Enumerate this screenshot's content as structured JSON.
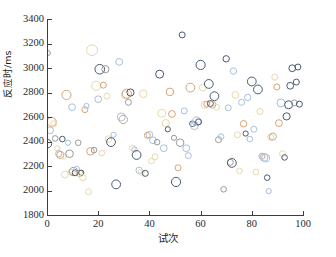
{
  "chart_data": {
    "type": "scatter",
    "title": "",
    "xlabel": "试次",
    "ylabel": "反应时/ms",
    "xlim": [
      0,
      100
    ],
    "ylim": [
      1800,
      3400
    ],
    "xticks": [
      0,
      20,
      40,
      60,
      80,
      100
    ],
    "xtick_labels": [
      "0",
      "20",
      "40",
      "60",
      "80",
      "100"
    ],
    "yticks": [
      1800,
      2000,
      2200,
      2400,
      2600,
      2800,
      3000,
      3200,
      3400
    ],
    "ytick_labels": [
      "1800",
      "2000",
      "2200",
      "2400",
      "2600",
      "2800",
      "3000",
      "3200",
      "3400"
    ],
    "grid": false,
    "legend": null,
    "marker": "open-circle",
    "marker_fill": "none",
    "palette": {
      "tan": "#d9a478",
      "light_blue": "#a8c0dd",
      "cream": "#e8d9a8",
      "gray": "#9a9a9a",
      "navy": "#4a5a72",
      "pale_orange": "#e8c49a",
      "pale_yellow": "#efe3bc"
    },
    "points": [
      {
        "x": 0.4,
        "y": 3122,
        "r": 2.4,
        "c": "gray"
      },
      {
        "x": 0.2,
        "y": 2382,
        "r": 4.2,
        "c": "navy"
      },
      {
        "x": 1.2,
        "y": 2492,
        "r": 3.4,
        "c": "light_blue"
      },
      {
        "x": 1.8,
        "y": 2560,
        "r": 4.6,
        "c": "tan"
      },
      {
        "x": 2.6,
        "y": 2545,
        "r": 3.0,
        "c": "cream"
      },
      {
        "x": 3.2,
        "y": 2425,
        "r": 2.8,
        "c": "gray"
      },
      {
        "x": 4.0,
        "y": 2345,
        "r": 2.6,
        "c": "cream"
      },
      {
        "x": 4.6,
        "y": 2300,
        "r": 3.2,
        "c": "light_blue"
      },
      {
        "x": 5.2,
        "y": 2290,
        "r": 3.6,
        "c": "tan"
      },
      {
        "x": 6.0,
        "y": 2420,
        "r": 2.8,
        "c": "navy"
      },
      {
        "x": 6.4,
        "y": 2280,
        "r": 3.0,
        "c": "cream"
      },
      {
        "x": 7.0,
        "y": 2130,
        "r": 3.4,
        "c": "cream"
      },
      {
        "x": 7.6,
        "y": 2780,
        "r": 4.6,
        "c": "tan"
      },
      {
        "x": 8.2,
        "y": 2390,
        "r": 2.6,
        "c": "light_blue"
      },
      {
        "x": 8.8,
        "y": 2300,
        "r": 3.8,
        "c": "gray"
      },
      {
        "x": 9.4,
        "y": 2150,
        "r": 3.0,
        "c": "cream"
      },
      {
        "x": 9.8,
        "y": 2680,
        "r": 3.4,
        "c": "light_blue"
      },
      {
        "x": 10.4,
        "y": 2155,
        "r": 4.2,
        "c": "gray"
      },
      {
        "x": 11.0,
        "y": 2145,
        "r": 3.0,
        "c": "navy"
      },
      {
        "x": 11.6,
        "y": 2175,
        "r": 2.8,
        "c": "light_blue"
      },
      {
        "x": 12.2,
        "y": 2390,
        "r": 2.8,
        "c": "gray"
      },
      {
        "x": 12.8,
        "y": 2140,
        "r": 3.2,
        "c": "tan"
      },
      {
        "x": 13.4,
        "y": 2145,
        "r": 2.6,
        "c": "navy"
      },
      {
        "x": 14.0,
        "y": 2105,
        "r": 3.2,
        "c": "cream"
      },
      {
        "x": 14.8,
        "y": 2660,
        "r": 3.0,
        "c": "tan"
      },
      {
        "x": 15.4,
        "y": 2690,
        "r": 2.6,
        "c": "light_blue"
      },
      {
        "x": 16.2,
        "y": 1990,
        "r": 3.0,
        "c": "cream"
      },
      {
        "x": 17.0,
        "y": 2320,
        "r": 3.8,
        "c": "tan"
      },
      {
        "x": 17.6,
        "y": 3145,
        "r": 5.4,
        "c": "cream"
      },
      {
        "x": 18.4,
        "y": 2330,
        "r": 2.8,
        "c": "gray"
      },
      {
        "x": 19.2,
        "y": 2855,
        "r": 4.6,
        "c": "cream"
      },
      {
        "x": 20.0,
        "y": 2745,
        "r": 3.4,
        "c": "light_blue"
      },
      {
        "x": 20.6,
        "y": 2990,
        "r": 4.8,
        "c": "navy"
      },
      {
        "x": 21.4,
        "y": 2305,
        "r": 2.8,
        "c": "cream"
      },
      {
        "x": 22.0,
        "y": 2860,
        "r": 3.0,
        "c": "tan"
      },
      {
        "x": 22.8,
        "y": 2990,
        "r": 3.6,
        "c": "gray"
      },
      {
        "x": 23.4,
        "y": 2770,
        "r": 3.0,
        "c": "cream"
      },
      {
        "x": 24.0,
        "y": 2420,
        "r": 3.2,
        "c": "cream"
      },
      {
        "x": 25.0,
        "y": 2395,
        "r": 4.4,
        "c": "navy"
      },
      {
        "x": 26.0,
        "y": 2455,
        "r": 2.6,
        "c": "light_blue"
      },
      {
        "x": 27.0,
        "y": 2050,
        "r": 4.4,
        "c": "navy"
      },
      {
        "x": 28.2,
        "y": 3050,
        "r": 3.4,
        "c": "light_blue"
      },
      {
        "x": 29.0,
        "y": 2600,
        "r": 4.0,
        "c": "light_blue"
      },
      {
        "x": 29.8,
        "y": 2580,
        "r": 4.2,
        "c": "tan"
      },
      {
        "x": 30.6,
        "y": 2780,
        "r": 4.0,
        "c": "cream"
      },
      {
        "x": 31.2,
        "y": 2790,
        "r": 4.6,
        "c": "tan"
      },
      {
        "x": 31.8,
        "y": 2720,
        "r": 3.0,
        "c": "gray"
      },
      {
        "x": 32.6,
        "y": 2800,
        "r": 3.6,
        "c": "navy"
      },
      {
        "x": 33.4,
        "y": 2345,
        "r": 3.0,
        "c": "cream"
      },
      {
        "x": 34.2,
        "y": 2335,
        "r": 2.6,
        "c": "light_blue"
      },
      {
        "x": 35.0,
        "y": 2290,
        "r": 4.4,
        "c": "navy"
      },
      {
        "x": 36.0,
        "y": 2165,
        "r": 3.2,
        "c": "light_blue"
      },
      {
        "x": 36.8,
        "y": 2150,
        "r": 3.0,
        "c": "cream"
      },
      {
        "x": 37.6,
        "y": 2790,
        "r": 3.8,
        "c": "cream"
      },
      {
        "x": 38.4,
        "y": 2140,
        "r": 3.0,
        "c": "navy"
      },
      {
        "x": 39.2,
        "y": 2450,
        "r": 3.0,
        "c": "tan"
      },
      {
        "x": 40.0,
        "y": 2455,
        "r": 3.4,
        "c": "light_blue"
      },
      {
        "x": 40.8,
        "y": 2240,
        "r": 2.8,
        "c": "cream"
      },
      {
        "x": 41.4,
        "y": 2410,
        "r": 3.4,
        "c": "light_blue"
      },
      {
        "x": 42.2,
        "y": 2275,
        "r": 3.0,
        "c": "cream"
      },
      {
        "x": 43.0,
        "y": 2395,
        "r": 2.8,
        "c": "gray"
      },
      {
        "x": 44.0,
        "y": 2950,
        "r": 4.0,
        "c": "navy"
      },
      {
        "x": 44.8,
        "y": 2630,
        "r": 4.0,
        "c": "cream"
      },
      {
        "x": 45.6,
        "y": 2345,
        "r": 3.4,
        "c": "light_blue"
      },
      {
        "x": 46.4,
        "y": 2550,
        "r": 3.6,
        "c": "cream"
      },
      {
        "x": 47.2,
        "y": 2500,
        "r": 2.6,
        "c": "navy"
      },
      {
        "x": 48.0,
        "y": 2805,
        "r": 3.8,
        "c": "tan"
      },
      {
        "x": 48.8,
        "y": 2625,
        "r": 3.4,
        "c": "tan"
      },
      {
        "x": 49.6,
        "y": 2430,
        "r": 2.6,
        "c": "gray"
      },
      {
        "x": 50.4,
        "y": 2070,
        "r": 4.6,
        "c": "navy"
      },
      {
        "x": 51.2,
        "y": 2185,
        "r": 3.0,
        "c": "tan"
      },
      {
        "x": 52.0,
        "y": 2390,
        "r": 3.8,
        "c": "gray"
      },
      {
        "x": 52.8,
        "y": 3270,
        "r": 3.0,
        "c": "navy"
      },
      {
        "x": 53.6,
        "y": 2650,
        "r": 3.0,
        "c": "light_blue"
      },
      {
        "x": 54.4,
        "y": 2345,
        "r": 3.4,
        "c": "light_blue"
      },
      {
        "x": 55.2,
        "y": 2285,
        "r": 3.0,
        "c": "light_blue"
      },
      {
        "x": 56.0,
        "y": 2840,
        "r": 4.4,
        "c": "tan"
      },
      {
        "x": 56.8,
        "y": 2545,
        "r": 2.8,
        "c": "navy"
      },
      {
        "x": 57.6,
        "y": 2530,
        "r": 4.0,
        "c": "light_blue"
      },
      {
        "x": 58.4,
        "y": 2565,
        "r": 4.4,
        "c": "light_blue"
      },
      {
        "x": 59.2,
        "y": 2560,
        "r": 3.0,
        "c": "navy"
      },
      {
        "x": 60.0,
        "y": 3025,
        "r": 4.6,
        "c": "navy"
      },
      {
        "x": 60.8,
        "y": 2840,
        "r": 3.4,
        "c": "cream"
      },
      {
        "x": 61.6,
        "y": 2700,
        "r": 3.6,
        "c": "cream"
      },
      {
        "x": 62.4,
        "y": 2705,
        "r": 3.0,
        "c": "tan"
      },
      {
        "x": 63.2,
        "y": 2870,
        "r": 4.4,
        "c": "navy"
      },
      {
        "x": 63.8,
        "y": 2710,
        "r": 3.0,
        "c": "navy"
      },
      {
        "x": 64.6,
        "y": 2700,
        "r": 3.4,
        "c": "tan"
      },
      {
        "x": 65.4,
        "y": 2770,
        "r": 4.4,
        "c": "navy"
      },
      {
        "x": 66.2,
        "y": 2680,
        "r": 3.0,
        "c": "cream"
      },
      {
        "x": 67.0,
        "y": 2415,
        "r": 3.0,
        "c": "gray"
      },
      {
        "x": 68.0,
        "y": 2440,
        "r": 2.8,
        "c": "light_blue"
      },
      {
        "x": 69.0,
        "y": 2010,
        "r": 2.8,
        "c": "gray"
      },
      {
        "x": 70.0,
        "y": 3075,
        "r": 3.2,
        "c": "navy"
      },
      {
        "x": 70.8,
        "y": 2675,
        "r": 3.0,
        "c": "light_blue"
      },
      {
        "x": 71.6,
        "y": 2230,
        "r": 3.0,
        "c": "gray"
      },
      {
        "x": 72.2,
        "y": 2225,
        "r": 4.4,
        "c": "navy"
      },
      {
        "x": 72.8,
        "y": 2975,
        "r": 3.2,
        "c": "light_blue"
      },
      {
        "x": 73.6,
        "y": 2780,
        "r": 3.4,
        "c": "cream"
      },
      {
        "x": 74.4,
        "y": 2455,
        "r": 3.0,
        "c": "cream"
      },
      {
        "x": 75.2,
        "y": 2160,
        "r": 2.8,
        "c": "cream"
      },
      {
        "x": 76.0,
        "y": 2720,
        "r": 3.0,
        "c": "light_blue"
      },
      {
        "x": 76.8,
        "y": 2545,
        "r": 3.2,
        "c": "tan"
      },
      {
        "x": 77.6,
        "y": 2465,
        "r": 2.6,
        "c": "navy"
      },
      {
        "x": 78.4,
        "y": 2760,
        "r": 3.2,
        "c": "light_blue"
      },
      {
        "x": 79.2,
        "y": 2420,
        "r": 2.8,
        "c": "light_blue"
      },
      {
        "x": 80.0,
        "y": 2890,
        "r": 4.4,
        "c": "navy"
      },
      {
        "x": 80.8,
        "y": 2500,
        "r": 3.0,
        "c": "light_blue"
      },
      {
        "x": 81.6,
        "y": 2150,
        "r": 2.8,
        "c": "cream"
      },
      {
        "x": 82.4,
        "y": 2825,
        "r": 4.4,
        "c": "navy"
      },
      {
        "x": 83.2,
        "y": 2645,
        "r": 3.0,
        "c": "cream"
      },
      {
        "x": 84.0,
        "y": 2280,
        "r": 3.0,
        "c": "tan"
      },
      {
        "x": 84.8,
        "y": 2270,
        "r": 3.8,
        "c": "light_blue"
      },
      {
        "x": 85.4,
        "y": 2265,
        "r": 4.0,
        "c": "light_blue"
      },
      {
        "x": 86.0,
        "y": 2105,
        "r": 2.8,
        "c": "navy"
      },
      {
        "x": 86.6,
        "y": 1995,
        "r": 2.6,
        "c": "light_blue"
      },
      {
        "x": 87.4,
        "y": 2435,
        "r": 3.0,
        "c": "cream"
      },
      {
        "x": 88.2,
        "y": 2440,
        "r": 3.6,
        "c": "tan"
      },
      {
        "x": 89.0,
        "y": 2925,
        "r": 3.0,
        "c": "cream"
      },
      {
        "x": 89.8,
        "y": 2845,
        "r": 3.0,
        "c": "tan"
      },
      {
        "x": 90.6,
        "y": 2550,
        "r": 3.4,
        "c": "tan"
      },
      {
        "x": 91.4,
        "y": 2715,
        "r": 4.0,
        "c": "light_blue"
      },
      {
        "x": 92.0,
        "y": 2300,
        "r": 3.0,
        "c": "cream"
      },
      {
        "x": 92.8,
        "y": 2270,
        "r": 2.8,
        "c": "navy"
      },
      {
        "x": 93.6,
        "y": 2605,
        "r": 3.6,
        "c": "navy"
      },
      {
        "x": 94.4,
        "y": 2700,
        "r": 4.0,
        "c": "navy"
      },
      {
        "x": 95.0,
        "y": 2855,
        "r": 3.4,
        "c": "navy"
      },
      {
        "x": 95.8,
        "y": 2998,
        "r": 3.4,
        "c": "navy"
      },
      {
        "x": 96.6,
        "y": 2715,
        "r": 3.0,
        "c": "gray"
      },
      {
        "x": 97.4,
        "y": 2885,
        "r": 3.0,
        "c": "navy"
      },
      {
        "x": 98.0,
        "y": 3008,
        "r": 3.0,
        "c": "navy"
      },
      {
        "x": 98.6,
        "y": 2705,
        "r": 3.0,
        "c": "navy"
      }
    ]
  }
}
